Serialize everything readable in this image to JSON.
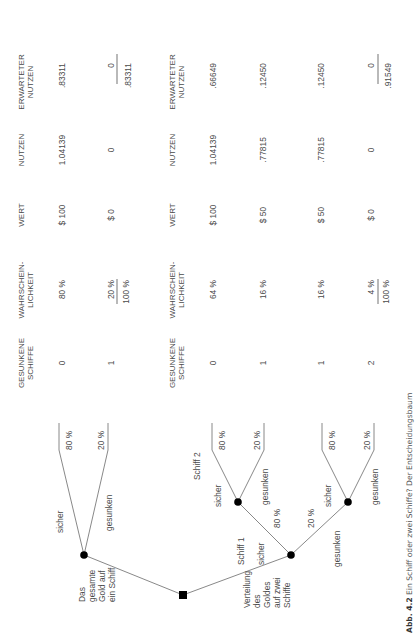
{
  "figure": {
    "caption_label": "Abb. 4.2",
    "caption_text": "Ein Schiff oder zwei Schiffe? Der Entscheidungsbaum",
    "orientation": "rotated 90° counter-clockwise"
  },
  "headers": {
    "sunk_1": "GESUNKENE",
    "sunk_2": "SCHIFFE",
    "prob_1": "WAHRSCHEIN-",
    "prob_2": "LICHKEIT",
    "value": "WERT",
    "utility": "NUTZEN",
    "exp_1": "ERWARTETER",
    "exp_2": "NUTZEN"
  },
  "tree": {
    "root_label": [],
    "option_one": {
      "label_lines": [
        "Das",
        "gesamte",
        "Gold auf",
        "ein Schiff"
      ],
      "branches": [
        {
          "label": "sicher",
          "prob": "80 %"
        },
        {
          "label": "gesunken",
          "prob": "20 %"
        }
      ]
    },
    "option_two": {
      "label_lines": [
        "Verteilung",
        "des",
        "Goldes",
        "auf zwei",
        "Schiffe"
      ],
      "ship1_label": "Schiff 1",
      "ship2_label": "Schiff 2",
      "ship1_branches": [
        {
          "label": "sicher",
          "prob": "80 %"
        },
        {
          "label": "gesunken",
          "prob": "20 %"
        }
      ],
      "ship2_upper_branches": [
        {
          "label": "sicher",
          "prob": "80 %"
        },
        {
          "label": "gesunken",
          "prob": "20 %"
        }
      ],
      "ship2_lower_branches": [
        {
          "label": "sicher",
          "prob": "80 %"
        },
        {
          "label": "gesunken",
          "prob": "20 %"
        }
      ]
    }
  },
  "table_one": {
    "rows": [
      {
        "sunk": "0",
        "prob": "80 %",
        "value": "$ 100",
        "utility": "1.04139",
        "expected": ".83311"
      },
      {
        "sunk": "1",
        "prob": "20 %",
        "value": "$ 0",
        "utility": "0",
        "expected": "0"
      }
    ],
    "total_prob": "100 %",
    "total_expected": ".83311"
  },
  "table_two": {
    "rows": [
      {
        "sunk": "0",
        "prob": "64 %",
        "value": "$ 100",
        "utility": "1.04139",
        "expected": ".66649"
      },
      {
        "sunk": "1",
        "prob": "16 %",
        "value": "$ 50",
        "utility": ".77815",
        "expected": ".12450"
      },
      {
        "sunk": "1",
        "prob": "16 %",
        "value": "$ 50",
        "utility": ".77815",
        "expected": ".12450"
      },
      {
        "sunk": "2",
        "prob": "4 %",
        "value": "$ 0",
        "utility": "0",
        "expected": "0"
      }
    ],
    "total_prob": "100 %",
    "total_expected": ".91549"
  }
}
